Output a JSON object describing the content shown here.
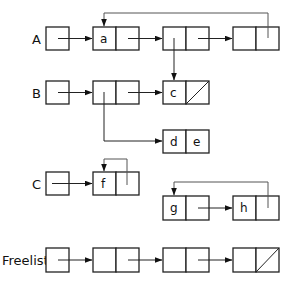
{
  "diagram": {
    "type": "linked-list-memory",
    "labels": {
      "A": "A",
      "B": "B",
      "C": "C",
      "freelist": "Freelist"
    },
    "cells": {
      "a": "a",
      "c": "c",
      "d": "d",
      "e": "e",
      "f": "f",
      "g": "g",
      "h": "h"
    },
    "colors": {
      "stroke": "#222222",
      "background": "#ffffff"
    }
  }
}
